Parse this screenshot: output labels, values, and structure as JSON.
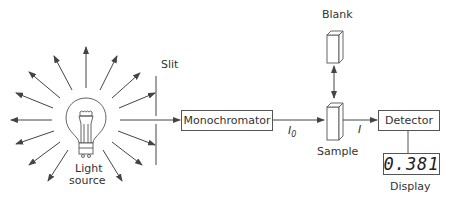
{
  "diagram": {
    "components": {
      "light_source": {
        "label_line1": "Light",
        "label_line2": "source"
      },
      "slit": {
        "label": "Slit"
      },
      "monochromator": {
        "label": "Monochromator"
      },
      "incident_beam": {
        "label_main": "I",
        "label_sub": "0"
      },
      "blank": {
        "label": "Blank"
      },
      "sample": {
        "label": "Sample"
      },
      "transmitted_beam": {
        "label": "I"
      },
      "detector": {
        "label": "Detector"
      },
      "display": {
        "label": "Display",
        "reading": "0.381"
      }
    },
    "colors": {
      "line": "#444444",
      "text": "#333333",
      "background": "#ffffff"
    }
  }
}
